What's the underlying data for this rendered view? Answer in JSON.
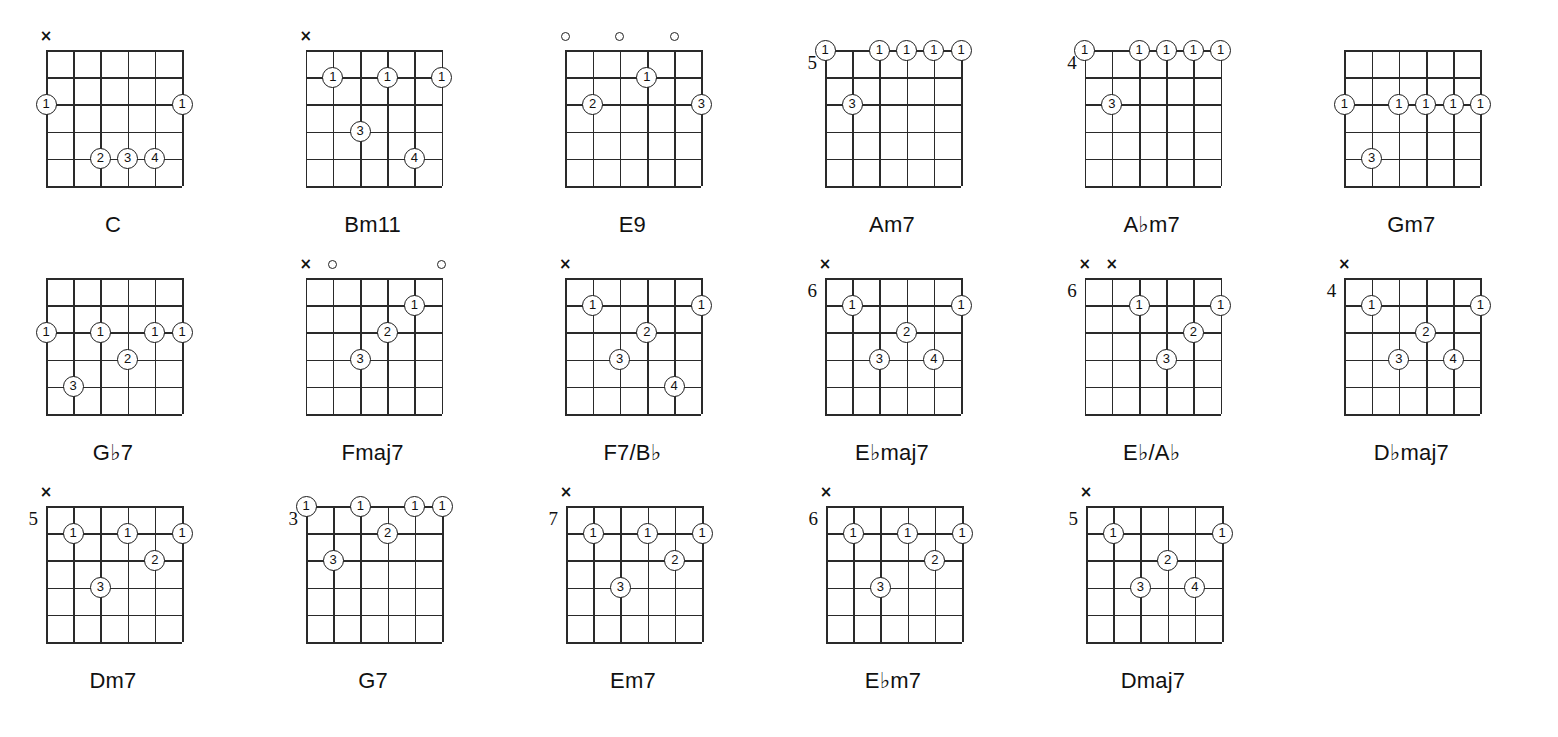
{
  "sheet": {
    "title": "Guitar Chord Diagrams",
    "strings": 6,
    "frets": 5,
    "marker_mute": "×",
    "marker_open": "o"
  },
  "legend": {
    "finger_1": "1",
    "finger_2": "2",
    "finger_3": "3",
    "finger_4": "4"
  },
  "chart_data": {
    "type": "table",
    "columns": 6,
    "rows": 3,
    "chords": [
      {
        "name": "C",
        "name_parts": [
          {
            "t": "C",
            "flat": false
          }
        ],
        "fret_label": "",
        "markers": [
          {
            "string": 1,
            "type": "mute"
          }
        ],
        "dots": [
          {
            "string": 1,
            "fret_line": 2,
            "finger": "1"
          },
          {
            "string": 6,
            "fret_line": 2,
            "finger": "1"
          },
          {
            "string": 3,
            "fret_line": 4,
            "finger": "2"
          },
          {
            "string": 4,
            "fret_line": 4,
            "finger": "3"
          },
          {
            "string": 5,
            "fret_line": 4,
            "finger": "4"
          }
        ]
      },
      {
        "name": "Bm11",
        "name_parts": [
          {
            "t": "Bm11",
            "flat": false
          }
        ],
        "fret_label": "",
        "markers": [
          {
            "string": 1,
            "type": "mute"
          }
        ],
        "dots": [
          {
            "string": 2,
            "fret_line": 1,
            "finger": "1"
          },
          {
            "string": 4,
            "fret_line": 1,
            "finger": "1"
          },
          {
            "string": 6,
            "fret_line": 1,
            "finger": "1"
          },
          {
            "string": 3,
            "fret_line": 3,
            "finger": "3"
          },
          {
            "string": 5,
            "fret_line": 4,
            "finger": "4"
          }
        ]
      },
      {
        "name": "E9",
        "name_parts": [
          {
            "t": "E9",
            "flat": false
          }
        ],
        "fret_label": "",
        "markers": [
          {
            "string": 1,
            "type": "open"
          },
          {
            "string": 3,
            "type": "open"
          },
          {
            "string": 5,
            "type": "open"
          }
        ],
        "dots": [
          {
            "string": 4,
            "fret_line": 1,
            "finger": "1"
          },
          {
            "string": 2,
            "fret_line": 2,
            "finger": "2"
          },
          {
            "string": 6,
            "fret_line": 2,
            "finger": "3"
          }
        ]
      },
      {
        "name": "Am7",
        "name_parts": [
          {
            "t": "Am7",
            "flat": false
          }
        ],
        "fret_label": "5",
        "markers": [],
        "dots": [
          {
            "string": 1,
            "fret_line": 0,
            "finger": "1"
          },
          {
            "string": 3,
            "fret_line": 0,
            "finger": "1"
          },
          {
            "string": 4,
            "fret_line": 0,
            "finger": "1"
          },
          {
            "string": 5,
            "fret_line": 0,
            "finger": "1"
          },
          {
            "string": 6,
            "fret_line": 0,
            "finger": "1"
          },
          {
            "string": 2,
            "fret_line": 2,
            "finger": "3"
          }
        ]
      },
      {
        "name": "A♭m7",
        "name_parts": [
          {
            "t": "A",
            "flat": false
          },
          {
            "t": "♭",
            "flat": true
          },
          {
            "t": "m7",
            "flat": false
          }
        ],
        "fret_label": "4",
        "markers": [],
        "dots": [
          {
            "string": 1,
            "fret_line": 0,
            "finger": "1"
          },
          {
            "string": 3,
            "fret_line": 0,
            "finger": "1"
          },
          {
            "string": 4,
            "fret_line": 0,
            "finger": "1"
          },
          {
            "string": 5,
            "fret_line": 0,
            "finger": "1"
          },
          {
            "string": 6,
            "fret_line": 0,
            "finger": "1"
          },
          {
            "string": 2,
            "fret_line": 2,
            "finger": "3"
          }
        ]
      },
      {
        "name": "Gm7",
        "name_parts": [
          {
            "t": "Gm7",
            "flat": false
          }
        ],
        "fret_label": "",
        "markers": [],
        "dots": [
          {
            "string": 1,
            "fret_line": 2,
            "finger": "1"
          },
          {
            "string": 3,
            "fret_line": 2,
            "finger": "1"
          },
          {
            "string": 4,
            "fret_line": 2,
            "finger": "1"
          },
          {
            "string": 5,
            "fret_line": 2,
            "finger": "1"
          },
          {
            "string": 6,
            "fret_line": 2,
            "finger": "1"
          },
          {
            "string": 2,
            "fret_line": 4,
            "finger": "3"
          }
        ]
      },
      {
        "name": "G♭7",
        "name_parts": [
          {
            "t": "G",
            "flat": false
          },
          {
            "t": "♭",
            "flat": true
          },
          {
            "t": "7",
            "flat": false
          }
        ],
        "fret_label": "",
        "markers": [],
        "dots": [
          {
            "string": 1,
            "fret_line": 2,
            "finger": "1"
          },
          {
            "string": 3,
            "fret_line": 2,
            "finger": "1"
          },
          {
            "string": 5,
            "fret_line": 2,
            "finger": "1"
          },
          {
            "string": 6,
            "fret_line": 2,
            "finger": "1"
          },
          {
            "string": 4,
            "fret_line": 3,
            "finger": "2"
          },
          {
            "string": 2,
            "fret_line": 4,
            "finger": "3"
          }
        ]
      },
      {
        "name": "Fmaj7",
        "name_parts": [
          {
            "t": "Fmaj7",
            "flat": false
          }
        ],
        "fret_label": "",
        "markers": [
          {
            "string": 1,
            "type": "mute"
          },
          {
            "string": 2,
            "type": "open"
          },
          {
            "string": 6,
            "type": "open"
          }
        ],
        "dots": [
          {
            "string": 5,
            "fret_line": 1,
            "finger": "1"
          },
          {
            "string": 4,
            "fret_line": 2,
            "finger": "2"
          },
          {
            "string": 3,
            "fret_line": 3,
            "finger": "3"
          }
        ]
      },
      {
        "name": "F7/B♭",
        "name_parts": [
          {
            "t": "F7/B",
            "flat": false
          },
          {
            "t": "♭",
            "flat": true
          }
        ],
        "fret_label": "",
        "markers": [
          {
            "string": 1,
            "type": "mute"
          }
        ],
        "dots": [
          {
            "string": 2,
            "fret_line": 1,
            "finger": "1"
          },
          {
            "string": 6,
            "fret_line": 1,
            "finger": "1"
          },
          {
            "string": 4,
            "fret_line": 2,
            "finger": "2"
          },
          {
            "string": 3,
            "fret_line": 3,
            "finger": "3"
          },
          {
            "string": 5,
            "fret_line": 4,
            "finger": "4"
          }
        ]
      },
      {
        "name": "E♭maj7",
        "name_parts": [
          {
            "t": "E",
            "flat": false
          },
          {
            "t": "♭",
            "flat": true
          },
          {
            "t": "maj7",
            "flat": false
          }
        ],
        "fret_label": "6",
        "markers": [
          {
            "string": 1,
            "type": "mute"
          }
        ],
        "dots": [
          {
            "string": 2,
            "fret_line": 1,
            "finger": "1"
          },
          {
            "string": 6,
            "fret_line": 1,
            "finger": "1"
          },
          {
            "string": 4,
            "fret_line": 2,
            "finger": "2"
          },
          {
            "string": 3,
            "fret_line": 3,
            "finger": "3"
          },
          {
            "string": 5,
            "fret_line": 3,
            "finger": "4"
          }
        ]
      },
      {
        "name": "E♭/A♭",
        "name_parts": [
          {
            "t": "E",
            "flat": false
          },
          {
            "t": "♭",
            "flat": true
          },
          {
            "t": "/A",
            "flat": false
          },
          {
            "t": "♭",
            "flat": true
          }
        ],
        "fret_label": "6",
        "markers": [
          {
            "string": 1,
            "type": "mute"
          },
          {
            "string": 2,
            "type": "mute"
          }
        ],
        "dots": [
          {
            "string": 3,
            "fret_line": 1,
            "finger": "1"
          },
          {
            "string": 6,
            "fret_line": 1,
            "finger": "1"
          },
          {
            "string": 5,
            "fret_line": 2,
            "finger": "2"
          },
          {
            "string": 4,
            "fret_line": 3,
            "finger": "3"
          }
        ]
      },
      {
        "name": "D♭maj7",
        "name_parts": [
          {
            "t": "D",
            "flat": false
          },
          {
            "t": "♭",
            "flat": true
          },
          {
            "t": "maj7",
            "flat": false
          }
        ],
        "fret_label": "4",
        "markers": [
          {
            "string": 1,
            "type": "mute"
          }
        ],
        "dots": [
          {
            "string": 2,
            "fret_line": 1,
            "finger": "1"
          },
          {
            "string": 6,
            "fret_line": 1,
            "finger": "1"
          },
          {
            "string": 4,
            "fret_line": 2,
            "finger": "2"
          },
          {
            "string": 3,
            "fret_line": 3,
            "finger": "3"
          },
          {
            "string": 5,
            "fret_line": 3,
            "finger": "4"
          }
        ]
      },
      {
        "name": "Dm7",
        "name_parts": [
          {
            "t": "Dm7",
            "flat": false
          }
        ],
        "fret_label": "5",
        "markers": [
          {
            "string": 1,
            "type": "mute"
          }
        ],
        "dots": [
          {
            "string": 2,
            "fret_line": 1,
            "finger": "1"
          },
          {
            "string": 4,
            "fret_line": 1,
            "finger": "1"
          },
          {
            "string": 6,
            "fret_line": 1,
            "finger": "1"
          },
          {
            "string": 5,
            "fret_line": 2,
            "finger": "2"
          },
          {
            "string": 3,
            "fret_line": 3,
            "finger": "3"
          }
        ]
      },
      {
        "name": "G7",
        "name_parts": [
          {
            "t": "G7",
            "flat": false
          }
        ],
        "fret_label": "3",
        "markers": [],
        "dots": [
          {
            "string": 1,
            "fret_line": 0,
            "finger": "1"
          },
          {
            "string": 3,
            "fret_line": 0,
            "finger": "1"
          },
          {
            "string": 5,
            "fret_line": 0,
            "finger": "1"
          },
          {
            "string": 6,
            "fret_line": 0,
            "finger": "1"
          },
          {
            "string": 4,
            "fret_line": 1,
            "finger": "2"
          },
          {
            "string": 2,
            "fret_line": 2,
            "finger": "3"
          }
        ]
      },
      {
        "name": "Em7",
        "name_parts": [
          {
            "t": "Em7",
            "flat": false
          }
        ],
        "fret_label": "7",
        "markers": [
          {
            "string": 1,
            "type": "mute"
          }
        ],
        "dots": [
          {
            "string": 2,
            "fret_line": 1,
            "finger": "1"
          },
          {
            "string": 4,
            "fret_line": 1,
            "finger": "1"
          },
          {
            "string": 6,
            "fret_line": 1,
            "finger": "1"
          },
          {
            "string": 5,
            "fret_line": 2,
            "finger": "2"
          },
          {
            "string": 3,
            "fret_line": 3,
            "finger": "3"
          }
        ]
      },
      {
        "name": "E♭m7",
        "name_parts": [
          {
            "t": "E",
            "flat": false
          },
          {
            "t": "♭",
            "flat": true
          },
          {
            "t": "m7",
            "flat": false
          }
        ],
        "fret_label": "6",
        "markers": [
          {
            "string": 1,
            "type": "mute"
          }
        ],
        "dots": [
          {
            "string": 2,
            "fret_line": 1,
            "finger": "1"
          },
          {
            "string": 4,
            "fret_line": 1,
            "finger": "1"
          },
          {
            "string": 6,
            "fret_line": 1,
            "finger": "1"
          },
          {
            "string": 5,
            "fret_line": 2,
            "finger": "2"
          },
          {
            "string": 3,
            "fret_line": 3,
            "finger": "3"
          }
        ]
      },
      {
        "name": "Dmaj7",
        "name_parts": [
          {
            "t": "Dmaj7",
            "flat": false
          }
        ],
        "fret_label": "5",
        "markers": [
          {
            "string": 1,
            "type": "mute"
          }
        ],
        "dots": [
          {
            "string": 2,
            "fret_line": 1,
            "finger": "1"
          },
          {
            "string": 6,
            "fret_line": 1,
            "finger": "1"
          },
          {
            "string": 4,
            "fret_line": 2,
            "finger": "2"
          },
          {
            "string": 3,
            "fret_line": 3,
            "finger": "3"
          },
          {
            "string": 5,
            "fret_line": 3,
            "finger": "4"
          }
        ]
      }
    ],
    "row_layout": [
      6,
      6,
      5
    ]
  }
}
